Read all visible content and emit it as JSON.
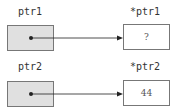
{
  "rows": [
    {
      "pointer_label": "ptr1",
      "target_label": "*ptr1",
      "target_value": "?"
    },
    {
      "pointer_label": "ptr2",
      "target_label": "*ptr2",
      "target_value": "44"
    }
  ],
  "colors": {
    "pointer_fill": "#e0e0e0",
    "border": "#777777",
    "arrow": "#222222"
  }
}
